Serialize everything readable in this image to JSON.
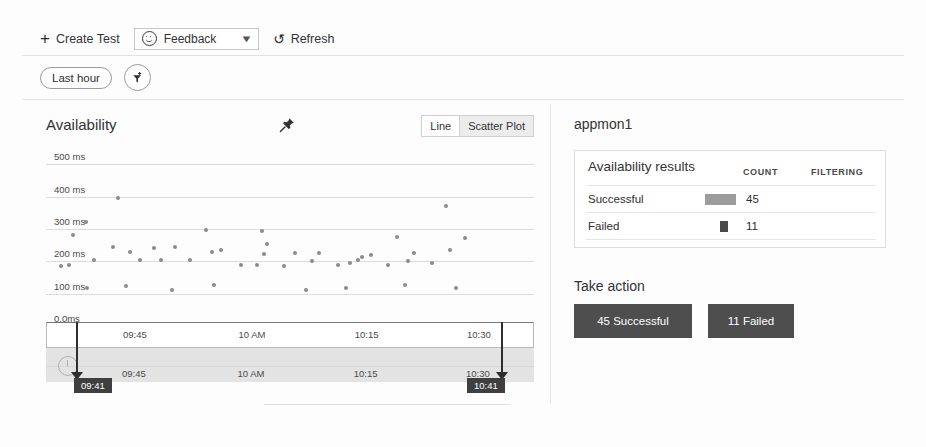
{
  "command_bar": {
    "create_test_label": "Create Test",
    "create_test_icon": "plus-icon",
    "feedback_value": "Feedback",
    "feedback_icon": "smiley-icon",
    "refresh_label": "Refresh",
    "refresh_icon": "refresh-icon"
  },
  "filter_bar": {
    "time_range_label": "Last hour",
    "add_filter_icon": "add-filter-funnel-icon"
  },
  "chart_panel": {
    "title": "Availability",
    "pin_icon": "pushpin-icon",
    "view_toggle": {
      "options": [
        "Line",
        "Scatter Plot"
      ],
      "selected": "Scatter Plot"
    }
  },
  "scrubber": {
    "ticks": [
      "09:45",
      "10 AM",
      "10:15",
      "10:30"
    ],
    "start_label": "09:41",
    "end_label": "10:41",
    "clock_icon": "clock-icon"
  },
  "right_panel": {
    "resource_name": "appmon1",
    "results_card": {
      "title": "Availability results",
      "columns": [
        "COUNT",
        "FILTERING"
      ],
      "rows": [
        {
          "label": "Successful",
          "count": "45",
          "swatch": "wide-gray",
          "color": "#9c9c9c"
        },
        {
          "label": "Failed",
          "count": "11",
          "swatch": "small-dark",
          "color": "#4a4a4a"
        }
      ]
    },
    "take_action": {
      "title": "Take action",
      "buttons": [
        {
          "label": "45 Successful"
        },
        {
          "label": "11 Failed"
        }
      ]
    }
  },
  "colors": {
    "success_swatch": "#9c9c9c",
    "failed_swatch": "#4a4a4a",
    "action_button": "#4e4e4e",
    "scatter_point": "#8a8a8a",
    "toggle_selected": "#ececec"
  },
  "chart_data": {
    "type": "scatter",
    "title": "Availability",
    "xlabel": "",
    "ylabel": "",
    "xtick_labels": [
      "09:45",
      "10 AM",
      "10:15",
      "10:30"
    ],
    "xtick_positions": [
      0.18,
      0.42,
      0.655,
      0.885
    ],
    "ytick_labels": [
      "0.0ms",
      "100 ms",
      "200 ms",
      "300 ms",
      "400 ms",
      "500 ms"
    ],
    "ylim": [
      0,
      550
    ],
    "grid": true,
    "legend_position": "none",
    "series": [
      {
        "name": "Successful",
        "color": "#8a8a8a",
        "count": 45,
        "points": [
          {
            "x": 0.03,
            "y": 186
          },
          {
            "x": 0.048,
            "y": 188
          },
          {
            "x": 0.055,
            "y": 280
          },
          {
            "x": 0.082,
            "y": 320
          },
          {
            "x": 0.083,
            "y": 118
          },
          {
            "x": 0.098,
            "y": 205
          },
          {
            "x": 0.137,
            "y": 243
          },
          {
            "x": 0.148,
            "y": 397
          },
          {
            "x": 0.163,
            "y": 123
          },
          {
            "x": 0.172,
            "y": 228
          },
          {
            "x": 0.192,
            "y": 205
          },
          {
            "x": 0.222,
            "y": 240
          },
          {
            "x": 0.236,
            "y": 203
          },
          {
            "x": 0.258,
            "y": 110
          },
          {
            "x": 0.265,
            "y": 243
          },
          {
            "x": 0.295,
            "y": 205
          },
          {
            "x": 0.327,
            "y": 297
          },
          {
            "x": 0.34,
            "y": 228
          },
          {
            "x": 0.345,
            "y": 127
          },
          {
            "x": 0.358,
            "y": 235
          },
          {
            "x": 0.4,
            "y": 190
          },
          {
            "x": 0.432,
            "y": 188
          },
          {
            "x": 0.443,
            "y": 292
          },
          {
            "x": 0.447,
            "y": 222
          },
          {
            "x": 0.452,
            "y": 253
          },
          {
            "x": 0.487,
            "y": 185
          },
          {
            "x": 0.51,
            "y": 225
          },
          {
            "x": 0.532,
            "y": 110
          },
          {
            "x": 0.545,
            "y": 200
          },
          {
            "x": 0.56,
            "y": 226
          },
          {
            "x": 0.598,
            "y": 187
          },
          {
            "x": 0.615,
            "y": 118
          },
          {
            "x": 0.622,
            "y": 196
          },
          {
            "x": 0.64,
            "y": 205
          },
          {
            "x": 0.648,
            "y": 213
          },
          {
            "x": 0.665,
            "y": 220
          },
          {
            "x": 0.7,
            "y": 190
          },
          {
            "x": 0.72,
            "y": 274
          },
          {
            "x": 0.735,
            "y": 128
          },
          {
            "x": 0.742,
            "y": 200
          },
          {
            "x": 0.755,
            "y": 226
          },
          {
            "x": 0.79,
            "y": 195
          },
          {
            "x": 0.82,
            "y": 370
          },
          {
            "x": 0.828,
            "y": 235
          },
          {
            "x": 0.84,
            "y": 118
          },
          {
            "x": 0.858,
            "y": 273
          }
        ]
      },
      {
        "name": "Failed",
        "color": "#555555",
        "count": 11,
        "points": [
          {
            "x": 0.738,
            "y": 0
          },
          {
            "x": 0.754,
            "y": 0
          },
          {
            "x": 0.77,
            "y": 0
          },
          {
            "x": 0.786,
            "y": 0
          },
          {
            "x": 0.802,
            "y": 0
          },
          {
            "x": 0.818,
            "y": 0
          },
          {
            "x": 0.834,
            "y": 0
          },
          {
            "x": 0.85,
            "y": 0
          },
          {
            "x": 0.888,
            "y": 0
          }
        ]
      }
    ]
  }
}
